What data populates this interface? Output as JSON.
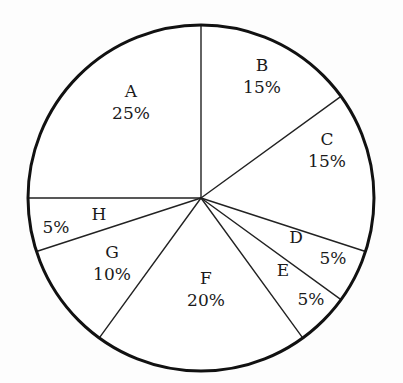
{
  "chart_data": {
    "type": "pie",
    "title": "",
    "subtitle": "",
    "xlabel": "",
    "ylabel": "",
    "legend_position": "none",
    "grid": false,
    "start_angle_deg": 0,
    "direction": "clockwise",
    "value_unit": "%",
    "total": 100,
    "categories": [
      "A",
      "B",
      "C",
      "D",
      "E",
      "F",
      "G",
      "H"
    ],
    "values": [
      25,
      15,
      15,
      5,
      5,
      20,
      10,
      5
    ],
    "slices": [
      {
        "name": "A",
        "value": 25,
        "value_label": "25%",
        "start_pct": 75,
        "end_pct": 100,
        "label_x": 131,
        "label_y": 102,
        "split_labels": false,
        "fill": "#ffffff"
      },
      {
        "name": "B",
        "value": 15,
        "value_label": "15%",
        "start_pct": 0,
        "end_pct": 15,
        "label_x": 262,
        "label_y": 76,
        "split_labels": false,
        "fill": "#ffffff"
      },
      {
        "name": "C",
        "value": 15,
        "value_label": "15%",
        "start_pct": 15,
        "end_pct": 30,
        "label_x": 327,
        "label_y": 150,
        "split_labels": false,
        "fill": "#ffffff"
      },
      {
        "name": "D",
        "value": 5,
        "value_label": "5%",
        "start_pct": 30,
        "end_pct": 35,
        "label_x": 296,
        "label_y": 237,
        "split_labels": true,
        "name_x": 296,
        "name_y": 237,
        "value_x": 333,
        "value_y": 258,
        "fill": "#ffffff"
      },
      {
        "name": "E",
        "value": 5,
        "value_label": "5%",
        "start_pct": 35,
        "end_pct": 40,
        "label_x": 283,
        "label_y": 270,
        "split_labels": true,
        "name_x": 283,
        "name_y": 270,
        "value_x": 311,
        "value_y": 299,
        "fill": "#ffffff"
      },
      {
        "name": "F",
        "value": 20,
        "value_label": "20%",
        "start_pct": 40,
        "end_pct": 60,
        "label_x": 206,
        "label_y": 289,
        "split_labels": false,
        "fill": "#ffffff"
      },
      {
        "name": "G",
        "value": 10,
        "value_label": "10%",
        "start_pct": 60,
        "end_pct": 70,
        "label_x": 112,
        "label_y": 263,
        "split_labels": false,
        "fill": "#ffffff"
      },
      {
        "name": "H",
        "value": 5,
        "value_label": "5%",
        "start_pct": 70,
        "end_pct": 75,
        "label_x": 99,
        "label_y": 214,
        "split_labels": true,
        "name_x": 99,
        "name_y": 214,
        "value_x": 56,
        "value_y": 227,
        "fill": "#ffffff"
      }
    ],
    "geometry": {
      "center_x": 201,
      "center_y": 198,
      "radius": 173,
      "outline_color": "#111111",
      "outline_width": 3,
      "divider_color": "#222222",
      "divider_width": 1.4,
      "background": "#fdfdfd"
    }
  }
}
